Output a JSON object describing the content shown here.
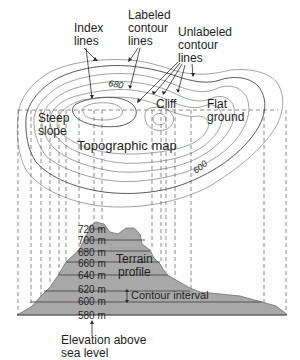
{
  "labels": {
    "index_lines": [
      "Index",
      "lines"
    ],
    "labeled_contour_lines": [
      "Labeled",
      "contour",
      "lines"
    ],
    "unlabeled_contour_lines": [
      "Unlabeled",
      "contour",
      "lines"
    ],
    "steep_slope": [
      "Steep",
      "slope"
    ],
    "cliff": "Cliff",
    "flat_ground": [
      "Flat",
      "ground"
    ],
    "topographic_map": "Topographic map",
    "terrain_profile": [
      "Terrain",
      "profile"
    ],
    "contour_interval": "Contour interval",
    "elevation_caption": [
      "Elevation above",
      "sea level"
    ]
  },
  "contour_values": {
    "label_680": "680",
    "label_600": "600"
  },
  "elevations": [
    "720 m",
    "700 m",
    "680 m",
    "660 m",
    "640 m",
    "620 m",
    "600 m",
    "580 m"
  ],
  "colors": {
    "terrain_fill": "#a8a8a8",
    "contour_line": "#8a8a8a",
    "index_line": "#5a5a5a"
  }
}
